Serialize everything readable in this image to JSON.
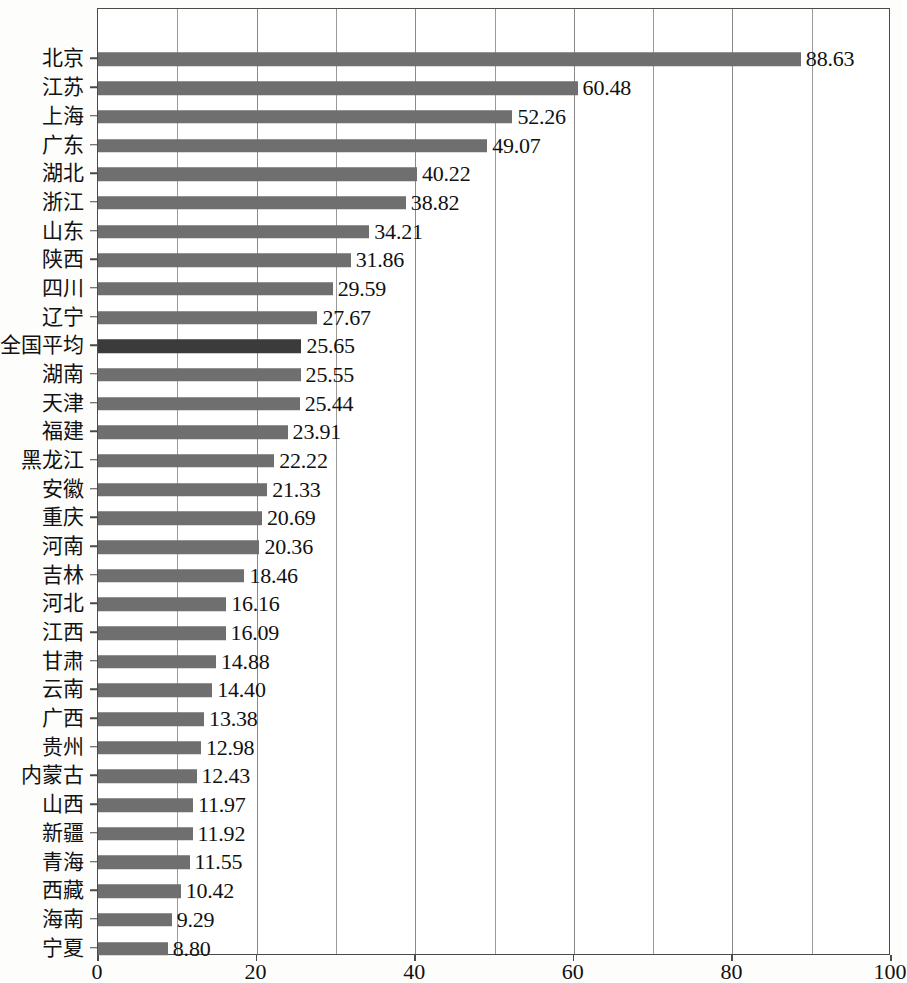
{
  "chart_data": {
    "type": "bar",
    "orientation": "horizontal",
    "title": "",
    "subtitle": "",
    "xlabel": "",
    "ylabel": "",
    "xlim": [
      0,
      100
    ],
    "xticks": [
      0,
      20,
      40,
      60,
      80,
      100
    ],
    "xtick_labels": [
      "0",
      "20",
      "40",
      "60",
      "80",
      "100"
    ],
    "gridlines_x": [
      0,
      10,
      20,
      30,
      40,
      50,
      60,
      70,
      80,
      90,
      100
    ],
    "grid": true,
    "legend": null,
    "bar_color": "#6f6f6f",
    "highlight_color": "#3b3b3b",
    "highlight_category": "全国平均",
    "categories": [
      "北京",
      "江苏",
      "上海",
      "广东",
      "湖北",
      "浙江",
      "山东",
      "陕西",
      "四川",
      "辽宁",
      "全国平均",
      "湖南",
      "天津",
      "福建",
      "黑龙江",
      "安徽",
      "重庆",
      "河南",
      "吉林",
      "河北",
      "江西",
      "甘肃",
      "云南",
      "广西",
      "贵州",
      "内蒙古",
      "山西",
      "新疆",
      "青海",
      "西藏",
      "海南",
      "宁夏"
    ],
    "values": [
      88.63,
      60.48,
      52.26,
      49.07,
      40.22,
      38.82,
      34.21,
      31.86,
      29.59,
      27.67,
      25.65,
      25.55,
      25.44,
      23.91,
      22.22,
      21.33,
      20.69,
      20.36,
      18.46,
      16.16,
      16.09,
      14.88,
      14.4,
      13.38,
      12.98,
      12.43,
      11.97,
      11.92,
      11.55,
      10.42,
      9.29,
      8.8
    ],
    "value_labels": [
      "88.63",
      "60.48",
      "52.26",
      "49.07",
      "40.22",
      "38.82",
      "34.21",
      "31.86",
      "29.59",
      "27.67",
      "25.65",
      "25.55",
      "25.44",
      "23.91",
      "22.22",
      "21.33",
      "20.69",
      "20.36",
      "18.46",
      "16.16",
      "16.09",
      "14.88",
      "14.40",
      "13.38",
      "12.98",
      "12.43",
      "11.97",
      "11.92",
      "11.55",
      "10.42",
      "9.29",
      "8.80"
    ]
  }
}
